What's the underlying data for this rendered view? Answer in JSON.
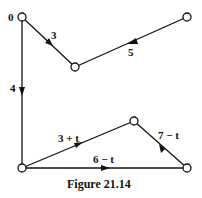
{
  "diagram": {
    "caption": "Figure 21.14",
    "nodes": [
      {
        "id": "A",
        "label": "0",
        "x": 22,
        "y": 17
      },
      {
        "id": "B",
        "label": "",
        "x": 75,
        "y": 67
      },
      {
        "id": "C",
        "label": "",
        "x": 187,
        "y": 17
      },
      {
        "id": "D",
        "label": "",
        "x": 22,
        "y": 168
      },
      {
        "id": "E",
        "label": "",
        "x": 134,
        "y": 121
      },
      {
        "id": "F",
        "label": "",
        "x": 187,
        "y": 168
      }
    ],
    "edges": [
      {
        "from": "A",
        "to": "B",
        "label": "3"
      },
      {
        "from": "C",
        "to": "B",
        "label": "5"
      },
      {
        "from": "A",
        "to": "D",
        "label": "4"
      },
      {
        "from": "D",
        "to": "E",
        "label": "3 + t"
      },
      {
        "from": "F",
        "to": "E",
        "label": "7 − t"
      },
      {
        "from": "D",
        "to": "F",
        "label": "6 − t"
      }
    ],
    "colors": {
      "line": "#111111",
      "background": "#ffffff"
    }
  }
}
